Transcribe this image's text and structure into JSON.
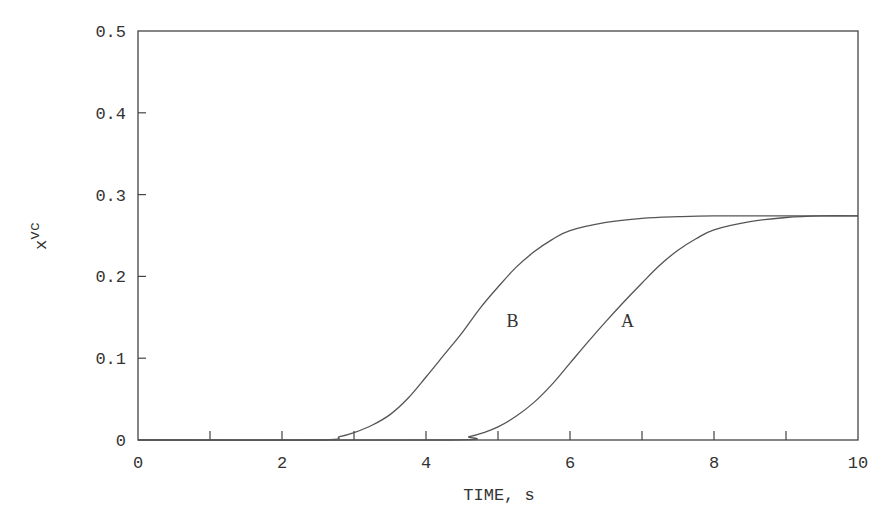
{
  "chart_data": {
    "type": "line",
    "title": "",
    "xlabel": "TIME, s",
    "ylabel": "x_vc",
    "ylabel_main": "x",
    "ylabel_sub": "vc",
    "xlim": [
      0,
      10
    ],
    "ylim": [
      0,
      0.5
    ],
    "grid": false,
    "legend": "inline labels",
    "x_ticks": [
      0,
      2,
      4,
      6,
      8,
      10
    ],
    "x_tick_labels": [
      "0",
      "2",
      "4",
      "6",
      "8",
      "10"
    ],
    "x_minor_ticks": [
      1,
      3,
      5,
      7,
      9
    ],
    "y_ticks": [
      0,
      0.1,
      0.2,
      0.3,
      0.4,
      0.5
    ],
    "y_tick_labels": [
      "0",
      "0.1",
      "0.2",
      "0.3",
      "0.4",
      "0.5"
    ],
    "series": [
      {
        "name": "B",
        "label_pos": [
          5.2,
          0.145
        ],
        "x": [
          0,
          2.5,
          2.8,
          3.0,
          3.25,
          3.5,
          3.75,
          4.0,
          4.25,
          4.5,
          4.75,
          5.0,
          5.25,
          5.5,
          5.75,
          6.0,
          6.5,
          7.0,
          7.5,
          8.0,
          9.0,
          10.0
        ],
        "y": [
          0,
          0,
          0.004,
          0.009,
          0.018,
          0.031,
          0.051,
          0.077,
          0.104,
          0.131,
          0.161,
          0.187,
          0.211,
          0.23,
          0.245,
          0.256,
          0.266,
          0.271,
          0.273,
          0.274,
          0.274,
          0.274
        ]
      },
      {
        "name": "A",
        "label_pos": [
          6.8,
          0.145
        ],
        "x": [
          0,
          4.3,
          4.6,
          4.8,
          5.0,
          5.25,
          5.5,
          5.75,
          6.0,
          6.25,
          6.5,
          6.75,
          7.0,
          7.25,
          7.5,
          7.75,
          8.0,
          8.5,
          9.0,
          9.5,
          10.0
        ],
        "y": [
          0,
          0,
          0.004,
          0.009,
          0.016,
          0.029,
          0.046,
          0.068,
          0.094,
          0.12,
          0.145,
          0.169,
          0.192,
          0.214,
          0.232,
          0.246,
          0.257,
          0.267,
          0.272,
          0.274,
          0.274
        ]
      }
    ]
  }
}
